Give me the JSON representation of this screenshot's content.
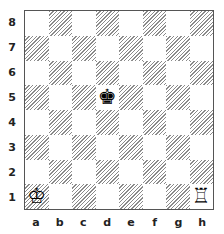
{
  "board": {
    "files": [
      "a",
      "b",
      "c",
      "d",
      "e",
      "f",
      "g",
      "h"
    ],
    "ranks": [
      "8",
      "7",
      "6",
      "5",
      "4",
      "3",
      "2",
      "1"
    ],
    "pieces": [
      {
        "square": "d5",
        "piece": "black-king",
        "glyph": "♚"
      },
      {
        "square": "a1",
        "piece": "white-king",
        "glyph": "♔"
      },
      {
        "square": "h1",
        "piece": "white-rook",
        "glyph": "♖"
      }
    ]
  }
}
